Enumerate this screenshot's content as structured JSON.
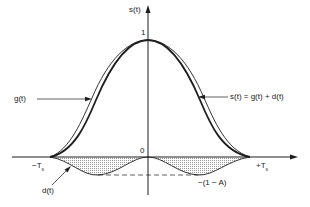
{
  "figure": {
    "type": "waveform-diagram",
    "colors": {
      "ink": "#1e1e1e",
      "hatch": "#bdbdbd",
      "background": "#ffffff"
    }
  },
  "axes": {
    "y_label": "s(t)",
    "peak_label": "1",
    "origin_label": "0",
    "x_left_label": "−T",
    "x_left_sub": "s",
    "x_right_label": "+T",
    "x_right_sub": "s"
  },
  "curves": {
    "g_label": "g(t)",
    "s_label": "s(t) = g(t) + d(t)",
    "d_label": "d(t)",
    "min_label": "−(1 − A)"
  }
}
